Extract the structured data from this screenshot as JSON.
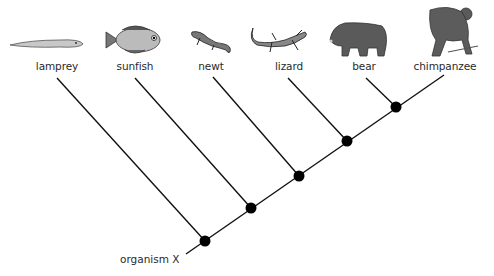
{
  "diagram": {
    "type": "cladogram",
    "root_label": "organism X",
    "taxa": [
      {
        "name": "lamprey",
        "icon": "lamprey-icon"
      },
      {
        "name": "sunfish",
        "icon": "sunfish-icon"
      },
      {
        "name": "newt",
        "icon": "newt-icon"
      },
      {
        "name": "lizard",
        "icon": "lizard-icon"
      },
      {
        "name": "bear",
        "icon": "bear-icon"
      },
      {
        "name": "chimpanzee",
        "icon": "chimpanzee-icon"
      }
    ],
    "node_count": 5,
    "colors": {
      "line": "#111111",
      "node": "#000000",
      "text": "#2a2a2a"
    }
  }
}
